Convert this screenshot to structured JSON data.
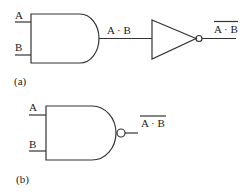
{
  "diagram": {
    "part_a": {
      "caption": "(a)",
      "and_gate": {
        "inputs": [
          "A",
          "B"
        ],
        "output_label": "A · B"
      },
      "inverter": {
        "output_label": "A · B",
        "output_overbar": true
      }
    },
    "part_b": {
      "caption": "(b)",
      "nand_gate": {
        "inputs": [
          "A",
          "B"
        ],
        "output_label": "A · B",
        "output_overbar": true
      }
    },
    "colors": {
      "line": "#333333",
      "background": "#ffffff"
    }
  }
}
